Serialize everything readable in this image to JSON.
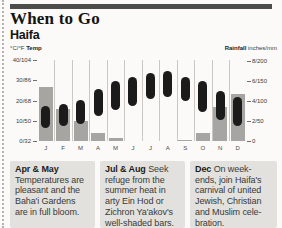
{
  "header": {
    "title": "When to Go",
    "city": "Haifa"
  },
  "chart": {
    "left_header_prefix": "°C/°F ",
    "left_header_bold": "Temp",
    "right_header_bold": "Rainfall",
    "right_header_suffix": " inches/mm"
  },
  "chart_data": {
    "type": "bar",
    "subtype": "climate chart: rainfall bars + monthly temperature range pills",
    "categories": [
      "J",
      "F",
      "M",
      "A",
      "M",
      "J",
      "J",
      "A",
      "S",
      "O",
      "N",
      "D"
    ],
    "series": [
      {
        "name": "Rainfall (inches, estimated from gridlines)",
        "values": [
          5.4,
          3.2,
          2.0,
          0.8,
          0.3,
          0,
          0,
          0,
          0.1,
          0.8,
          3.4,
          4.7
        ]
      },
      {
        "name": "Temperature high (°C, estimated)",
        "values": [
          17,
          18,
          20,
          25,
          29,
          31,
          33,
          34,
          31,
          29,
          24,
          21
        ]
      },
      {
        "name": "Temperature low (°C, estimated)",
        "values": [
          7,
          8,
          9,
          13,
          16,
          18,
          21,
          22,
          20,
          15,
          11,
          8
        ]
      }
    ],
    "left_axis": {
      "label": "°C/°F Temp",
      "ticks": [
        "40/104",
        "30/86",
        "20/68",
        "10/50",
        "0/32"
      ],
      "range_c": [
        0,
        40
      ]
    },
    "right_axis": {
      "label": "Rainfall inches/mm",
      "ticks": [
        "8/200",
        "6/150",
        "4/100",
        "2/50",
        "0"
      ],
      "range_inches": [
        0,
        8
      ]
    },
    "grid": "vertical separators between months",
    "legend_position": "none"
  },
  "notes": [
    {
      "lead": "Apr & May",
      "body": "\nTemperatures are\npleasant and the\nBaha'i Gardens\nare in full bloom."
    },
    {
      "lead": "Jul & Aug ",
      "body": "Seek\nrefuge from the\nsummer heat in\narty Ein Hod or\nZichron Ya'akov's\nwell-shaded bars."
    },
    {
      "lead": "Dec ",
      "body": "On week-\nends, join Haifa's\ncarnival of united\nJewish, Christian\nand Muslim cele-\nbration."
    }
  ],
  "colors": {
    "rule_bar": "#4c4c4a",
    "rain_bar": "#a6a5a2",
    "temp_pill": "#1b1b1b",
    "grid_line": "#c9c8c5",
    "note_background": "#e2e1de",
    "paper": "#fbfaf8"
  }
}
